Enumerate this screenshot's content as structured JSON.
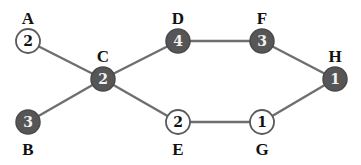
{
  "graph": {
    "nodes": [
      {
        "id": "A",
        "label": "A",
        "value": "2",
        "filled": false,
        "x": 28,
        "y": 41,
        "label_pos": "above"
      },
      {
        "id": "B",
        "label": "B",
        "value": "3",
        "filled": true,
        "x": 28,
        "y": 122,
        "label_pos": "below"
      },
      {
        "id": "C",
        "label": "C",
        "value": "2",
        "filled": true,
        "x": 103,
        "y": 79,
        "label_pos": "above"
      },
      {
        "id": "D",
        "label": "D",
        "value": "4",
        "filled": true,
        "x": 178,
        "y": 41,
        "label_pos": "above"
      },
      {
        "id": "E",
        "label": "E",
        "value": "2",
        "filled": false,
        "x": 178,
        "y": 122,
        "label_pos": "below"
      },
      {
        "id": "F",
        "label": "F",
        "value": "3",
        "filled": true,
        "x": 262,
        "y": 41,
        "label_pos": "above"
      },
      {
        "id": "G",
        "label": "G",
        "value": "1",
        "filled": false,
        "x": 262,
        "y": 122,
        "label_pos": "below"
      },
      {
        "id": "H",
        "label": "H",
        "value": "1",
        "filled": true,
        "x": 335,
        "y": 79,
        "label_pos": "above"
      }
    ],
    "edges": [
      [
        "A",
        "C"
      ],
      [
        "B",
        "C"
      ],
      [
        "C",
        "D"
      ],
      [
        "C",
        "E"
      ],
      [
        "D",
        "F"
      ],
      [
        "F",
        "H"
      ],
      [
        "E",
        "G"
      ],
      [
        "G",
        "H"
      ]
    ],
    "colors": {
      "filled_node": "#565656",
      "empty_node": "#ffffff",
      "edge": "#6e6e6e"
    }
  }
}
